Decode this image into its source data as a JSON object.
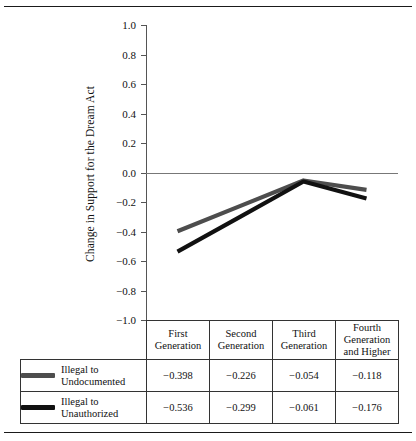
{
  "chart_data": {
    "type": "line",
    "title": "",
    "xlabel": "",
    "ylabel": "Change in Support for the Dream Act",
    "ylim": [
      -1.0,
      1.0
    ],
    "yticks": [
      "1.0",
      "0.8",
      "0.6",
      "0.4",
      "0.2",
      "0.0",
      "-0.2",
      "-0.4",
      "-0.6",
      "-0.8",
      "-1.0"
    ],
    "ytick_values": [
      1.0,
      0.8,
      0.6,
      0.4,
      0.2,
      0.0,
      -0.2,
      -0.4,
      -0.6,
      -0.8,
      -1.0
    ],
    "grid": false,
    "legend_position": "table-below",
    "zero_reference_line": true,
    "categories": [
      "First Generation",
      "Second Generation",
      "Third Generation",
      "Fourth Generation and Higher"
    ],
    "series": [
      {
        "name": "Illegal to Undocumented",
        "color": "#4d4d4d",
        "values": [
          -0.398,
          -0.226,
          -0.054,
          -0.118
        ],
        "labels": [
          "-0.398",
          "-0.226",
          "-0.054",
          "-0.118"
        ]
      },
      {
        "name": "Illegal to Unauthorized",
        "color": "#111111",
        "values": [
          -0.536,
          -0.299,
          -0.061,
          -0.176
        ],
        "labels": [
          "-0.536",
          "-0.299",
          "-0.061",
          "-0.176"
        ]
      }
    ]
  },
  "axis": {
    "ylabel": "Change in Support for the Dream Act",
    "ticks": [
      {
        "label": "1.0"
      },
      {
        "label": "0.8"
      },
      {
        "label": "0.6"
      },
      {
        "label": "0.4"
      },
      {
        "label": "0.2"
      },
      {
        "label": "0.0"
      },
      {
        "label": "-0.2"
      },
      {
        "label": "-0.4"
      },
      {
        "label": "-0.6"
      },
      {
        "label": "-0.8"
      },
      {
        "label": "-1.0"
      }
    ]
  },
  "table": {
    "headers": [
      {
        "line1": "First",
        "line2": "Generation",
        "line3": ""
      },
      {
        "line1": "Second",
        "line2": "Generation",
        "line3": ""
      },
      {
        "line1": "Third",
        "line2": "Generation",
        "line3": ""
      },
      {
        "line1": "Fourth",
        "line2": "Generation",
        "line3": "and Higher"
      }
    ],
    "rows": [
      {
        "label_line1": "Illegal to",
        "label_line2": "Undocumented",
        "swatch_color": "#4d4d4d",
        "values": [
          "-0.398",
          "-0.226",
          "-0.054",
          "-0.118"
        ]
      },
      {
        "label_line1": "Illegal to",
        "label_line2": "Unauthorized",
        "swatch_color": "#111111",
        "values": [
          "-0.536",
          "-0.299",
          "-0.061",
          "-0.176"
        ]
      }
    ]
  }
}
